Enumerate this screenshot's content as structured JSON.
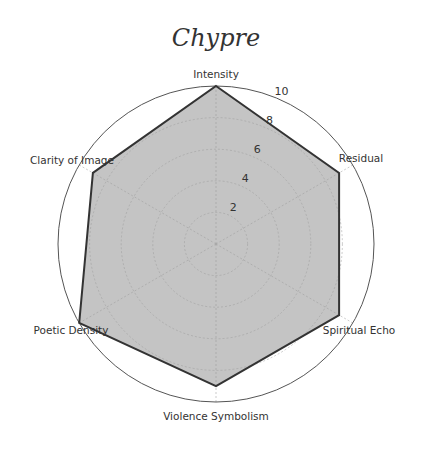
{
  "chart_data": {
    "type": "radar",
    "title": "Chypre",
    "categories": [
      "Intensity",
      "Residual",
      "Spiritual Echo",
      "Violence Symbolism",
      "Poetic Density",
      "Clarity of Image"
    ],
    "values": [
      10,
      9,
      9,
      9,
      10,
      9
    ],
    "rlim": [
      0,
      10
    ],
    "rticks": [
      "2",
      "4",
      "6",
      "8",
      "10"
    ],
    "rtick_values": [
      2,
      4,
      6,
      8,
      10
    ],
    "grid": true,
    "legend": null,
    "xlabel": "",
    "ylabel": "",
    "colors": {
      "fill": "#c4c4c4",
      "edge": "#333333",
      "outer_ring": "#555555",
      "grid": "#9a9a9a"
    }
  }
}
